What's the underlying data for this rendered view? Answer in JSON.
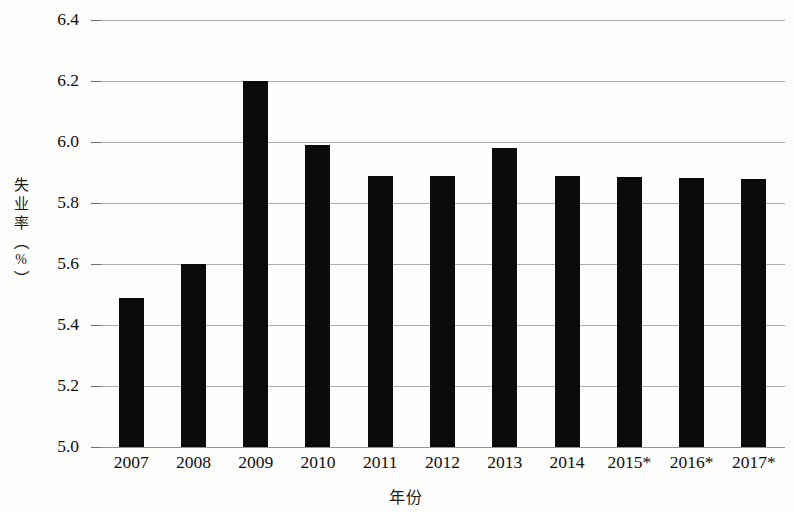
{
  "chart_data": {
    "type": "bar",
    "title": "",
    "xlabel": "年份",
    "ylabel": "失业率（%）",
    "ylabel_chars": [
      "失",
      "业",
      "率"
    ],
    "ylabel_paren_open": "（",
    "ylabel_paren_close": "）",
    "ylabel_unit": "%",
    "categories": [
      "2007",
      "2008",
      "2009",
      "2010",
      "2011",
      "2012",
      "2013",
      "2014",
      "2015*",
      "2016*",
      "2017*"
    ],
    "values": [
      5.49,
      5.6,
      6.2,
      5.99,
      5.89,
      5.89,
      5.98,
      5.89,
      5.885,
      5.883,
      5.88
    ],
    "ylim": [
      5.0,
      6.4
    ],
    "ytick_labels": [
      "5.0",
      "5.2",
      "5.4",
      "5.6",
      "5.8",
      "6.0",
      "6.2",
      "6.4"
    ],
    "ytick_values": [
      5.0,
      5.2,
      5.4,
      5.6,
      5.8,
      6.0,
      6.2,
      6.4
    ],
    "grid": true,
    "legend": "none",
    "bar_color": "#0b0b0b",
    "grid_color": "#9a9a9a",
    "note": "* 表示预测值"
  }
}
